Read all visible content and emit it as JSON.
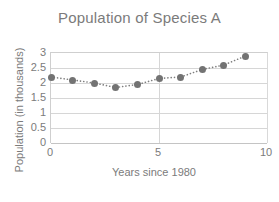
{
  "chart_data": {
    "type": "scatter",
    "title": "Population of Species A",
    "xlabel": "Years since 1980",
    "ylabel": "Population (in thousands)",
    "x": [
      0,
      1,
      2,
      3,
      4,
      5,
      6,
      7,
      8,
      9
    ],
    "values": [
      2.2,
      2.1,
      2.0,
      1.85,
      1.95,
      2.15,
      2.2,
      2.45,
      2.6,
      2.9
    ],
    "series": [
      {
        "name": "Population",
        "x": [
          0,
          1,
          2,
          3,
          4,
          5,
          6,
          7,
          8,
          9
        ],
        "values": [
          2.2,
          2.1,
          2.0,
          1.85,
          1.95,
          2.15,
          2.2,
          2.45,
          2.6,
          2.9
        ]
      }
    ],
    "xlim": [
      0,
      10
    ],
    "ylim": [
      0,
      3
    ],
    "xticks": [
      0,
      5,
      10
    ],
    "xtick_labels": [
      "0",
      "5",
      "10"
    ],
    "yticks": [
      0,
      0.5,
      1,
      1.5,
      2,
      2.5,
      3
    ],
    "ytick_labels": [
      "0",
      "0.5",
      "1",
      "1.5",
      "2",
      "2.5",
      "3"
    ],
    "grid": "horizontal",
    "legend": "none",
    "marker_style": "filled-circle",
    "line_style": "dotted",
    "marker_color": "#737373",
    "line_color": "#7f7f7f",
    "grid_color": "#d6d6d6",
    "text_color": "#7b7b7b"
  },
  "axis": {
    "y_labels": [
      "3",
      "2.5",
      "2",
      "1.5",
      "1",
      "0.5",
      "0"
    ],
    "x_labels": [
      "0",
      "5",
      "10"
    ]
  }
}
